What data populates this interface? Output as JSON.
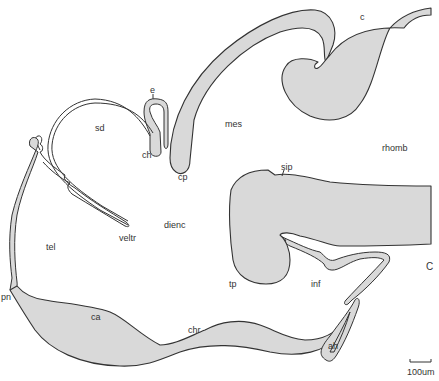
{
  "figure": {
    "type": "anatomical-section-drawing",
    "colors": {
      "tissue_fill": "#d9d9d9",
      "outline": "#333333",
      "background": "#ffffff"
    },
    "panel_label": "C",
    "scale_bar": {
      "label": "100um"
    },
    "labels": [
      {
        "id": "c",
        "text": "c",
        "x": 360,
        "y": 13
      },
      {
        "id": "e",
        "text": "e",
        "x": 150,
        "y": 86
      },
      {
        "id": "sd",
        "text": "sd",
        "x": 95,
        "y": 124
      },
      {
        "id": "ch",
        "text": "ch",
        "x": 142,
        "y": 151
      },
      {
        "id": "cp",
        "text": "cp",
        "x": 178,
        "y": 173
      },
      {
        "id": "mes",
        "text": "mes",
        "x": 225,
        "y": 120
      },
      {
        "id": "rhomb",
        "text": "rhomb",
        "x": 382,
        "y": 144
      },
      {
        "id": "sip",
        "text": "sip",
        "x": 281,
        "y": 165
      },
      {
        "id": "dienc",
        "text": "dienc",
        "x": 164,
        "y": 221
      },
      {
        "id": "veltr",
        "text": "veltr",
        "x": 119,
        "y": 234
      },
      {
        "id": "tel",
        "text": "tel",
        "x": 46,
        "y": 243
      },
      {
        "id": "tp",
        "text": "tp",
        "x": 229,
        "y": 280
      },
      {
        "id": "inf",
        "text": "inf",
        "x": 311,
        "y": 280
      },
      {
        "id": "pn",
        "text": "pn",
        "x": 1,
        "y": 293
      },
      {
        "id": "ca",
        "text": "ca",
        "x": 91,
        "y": 313
      },
      {
        "id": "chr",
        "text": "chr",
        "x": 188,
        "y": 326
      },
      {
        "id": "ah",
        "text": "ah",
        "x": 328,
        "y": 342
      }
    ]
  }
}
